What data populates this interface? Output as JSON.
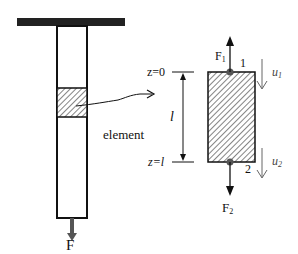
{
  "diagram": {
    "left_figure": {
      "force_label": "F",
      "element_label": "element"
    },
    "right_figure": {
      "z_top_label": "z=0",
      "z_bottom_label": "z=l",
      "length_label": "l",
      "node_top": "1",
      "node_bottom": "2",
      "force_top": "F",
      "force_top_sub": "1",
      "force_bottom": "F",
      "force_bottom_sub": "2",
      "disp_top": "u",
      "disp_top_sub": "1",
      "disp_bottom": "u",
      "disp_bottom_sub": "2"
    },
    "colors": {
      "line": "#111111",
      "force_arrow": "#555555",
      "hatch": "#333333",
      "displacement_arrow": "#666666"
    }
  }
}
